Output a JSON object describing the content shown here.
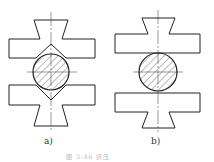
{
  "figure": {
    "caption": "图 3-46 挤压",
    "panels": [
      {
        "id": "a",
        "label": "a)",
        "description": "V-shaped dies gripping round bar"
      },
      {
        "id": "b",
        "label": "b)",
        "description": "Flat dies gripping round bar"
      }
    ],
    "colors": {
      "stroke": "#222222",
      "hatch": "#444444",
      "centerline": "#555555"
    }
  }
}
